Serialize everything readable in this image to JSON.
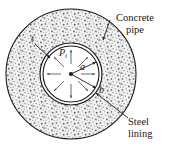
{
  "figure": {
    "type": "engineering-cross-section-diagram",
    "background_color": "#ffffff",
    "ink_color": "#1a1a1a",
    "concrete_fill_color": "#efefef",
    "stipple_color": "#6e6e6e"
  },
  "geometry": {
    "center": {
      "x": 71,
      "y": 74
    },
    "concrete_outer_radius": 65,
    "steel_outer_radius": 31,
    "steel_inner_radius": 28,
    "pressure_arrow_count": 8
  },
  "callouts": {
    "concrete_pipe": {
      "line1": "Concrete",
      "line2": "pipe"
    },
    "steel_lining": {
      "line1": "Steel",
      "line2": "lining"
    }
  },
  "symbols": {
    "pressure": {
      "base": "P",
      "subscript": "i",
      "meaning": "internal pressure"
    },
    "inner_radius": {
      "base": "a",
      "meaning": "inner radius"
    },
    "outer_radius": {
      "base": "b",
      "meaning": "outer radius of steel lining"
    },
    "thickness": {
      "base": "t",
      "meaning": "steel lining thickness"
    }
  }
}
